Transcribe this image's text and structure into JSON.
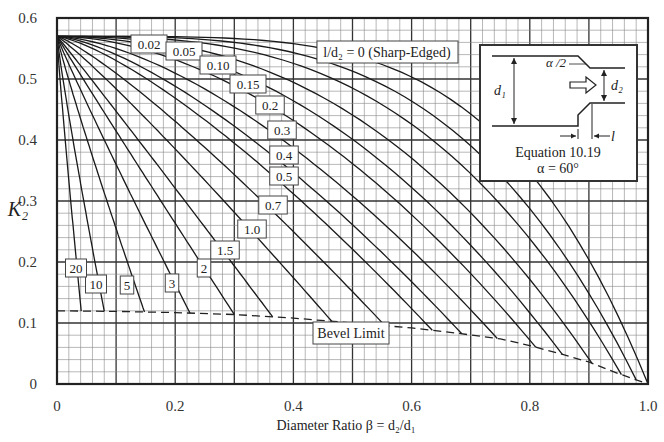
{
  "chart_data": {
    "type": "line",
    "title": "",
    "xlabel": "Diameter Ratio β = d2/d1",
    "ylabel": "K2",
    "xlim": [
      0,
      1.0
    ],
    "ylim": [
      0,
      0.6
    ],
    "x_ticks": [
      "0",
      "0.2",
      "0.4",
      "0.6",
      "0.8",
      "1.0"
    ],
    "y_ticks": [
      "0",
      "0.1",
      "0.2",
      "0.3",
      "0.4",
      "0.5",
      "0.6"
    ],
    "grid": true,
    "legend": "none (inline curve labels)",
    "parameter": "l/d2",
    "k_start": 0.57,
    "series": [
      {
        "name": "l/d2 = 0 (Sharp-Edged)",
        "end_beta": 1.0,
        "shape": 4.2
      },
      {
        "name": "0.02",
        "end_beta": 0.98,
        "shape": 3.4
      },
      {
        "name": "0.05",
        "end_beta": 0.955,
        "shape": 2.9
      },
      {
        "name": "0.10",
        "end_beta": 0.905,
        "shape": 2.4
      },
      {
        "name": "0.15",
        "end_beta": 0.855,
        "shape": 2.1
      },
      {
        "name": "0.2",
        "end_beta": 0.81,
        "shape": 1.85
      },
      {
        "name": "0.3",
        "end_beta": 0.745,
        "shape": 1.6
      },
      {
        "name": "0.4",
        "end_beta": 0.685,
        "shape": 1.45
      },
      {
        "name": "0.5",
        "end_beta": 0.635,
        "shape": 1.35
      },
      {
        "name": "0.7",
        "end_beta": 0.555,
        "shape": 1.2
      },
      {
        "name": "1.0",
        "end_beta": 0.465,
        "shape": 1.1
      },
      {
        "name": "1.5",
        "end_beta": 0.365,
        "shape": 1.02
      },
      {
        "name": "2",
        "end_beta": 0.3,
        "shape": 0.98
      },
      {
        "name": "3",
        "end_beta": 0.225,
        "shape": 0.95
      },
      {
        "name": "5",
        "end_beta": 0.148,
        "shape": 0.92
      },
      {
        "name": "10",
        "end_beta": 0.08,
        "shape": 0.9
      },
      {
        "name": "20",
        "end_beta": 0.041,
        "shape": 0.9
      }
    ],
    "bevel_limit": {
      "name": "Bevel Limit",
      "style": "dashed",
      "points": [
        [
          0,
          0.12
        ],
        [
          0.1,
          0.119
        ],
        [
          0.2,
          0.117
        ],
        [
          0.3,
          0.114
        ],
        [
          0.4,
          0.108
        ],
        [
          0.5,
          0.1
        ],
        [
          0.6,
          0.092
        ],
        [
          0.68,
          0.083
        ],
        [
          0.75,
          0.074
        ],
        [
          0.8,
          0.063
        ],
        [
          0.85,
          0.05
        ],
        [
          0.9,
          0.036
        ],
        [
          0.95,
          0.017
        ],
        [
          1.0,
          0
        ]
      ]
    },
    "annotations": [
      {
        "text": "l/d2 = 0 (Sharp-Edged)"
      },
      {
        "text": "Bevel Limit"
      }
    ]
  },
  "labels": {
    "sharp": "l/d₂ = 0 (Sharp-Edged)",
    "bevel": "Bevel Limit",
    "xlabel": "Diameter Ratio β = d₂/d₁",
    "ylabel": "K₂"
  },
  "inset": {
    "equation": "Equation 10.19",
    "alpha": "α = 60°",
    "half_angle": "α /2",
    "d1": "d₁",
    "d2": "d₂",
    "l": "l"
  },
  "curve_labels": [
    {
      "text": "0.02",
      "x": 149,
      "y": 44
    },
    {
      "text": "0.05",
      "x": 184,
      "y": 51
    },
    {
      "text": "0.10",
      "x": 218,
      "y": 65
    },
    {
      "text": "0.15",
      "x": 248,
      "y": 84
    },
    {
      "text": "0.2",
      "x": 270,
      "y": 105
    },
    {
      "text": "0.3",
      "x": 282,
      "y": 130
    },
    {
      "text": "0.4",
      "x": 284,
      "y": 155
    },
    {
      "text": "0.5",
      "x": 284,
      "y": 176
    },
    {
      "text": "0.7",
      "x": 273,
      "y": 205
    },
    {
      "text": "1.0",
      "x": 252,
      "y": 229
    },
    {
      "text": "1.5",
      "x": 225,
      "y": 250
    },
    {
      "text": "2",
      "x": 204,
      "y": 268
    },
    {
      "text": "3",
      "x": 172,
      "y": 283
    },
    {
      "text": "5",
      "x": 127,
      "y": 285
    },
    {
      "text": "10",
      "x": 96,
      "y": 284
    },
    {
      "text": "20",
      "x": 76,
      "y": 268
    }
  ]
}
